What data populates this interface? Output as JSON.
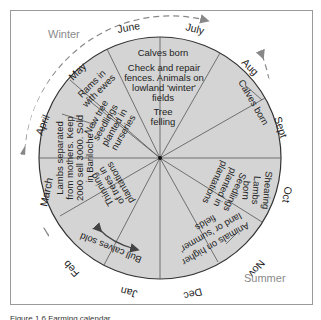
{
  "diagram": {
    "type": "annual-farming-calendar-wheel",
    "colors": {
      "inner_fill": "#d4d4d4",
      "ring_fill": "#ffffff",
      "line": "#555555",
      "dash": "#888888",
      "season_text": "#8a8a8a"
    },
    "seasons": {
      "winter": "Winter",
      "summer": "Summer"
    },
    "months": [
      "June",
      "July",
      "Aug",
      "Sept",
      "Oct",
      "Nov",
      "Dec",
      "Jan",
      "Feb",
      "March",
      "April",
      "May"
    ],
    "activities": {
      "june_july_top": {
        "line1": "Calves born",
        "line2": "Check and repair",
        "line3": "fences. Animals on",
        "line4": "lowland 'winter'",
        "line5": "fields",
        "line6": "Tree",
        "line7": "felling"
      },
      "aug": "Calves born",
      "oct": {
        "line1": "Shearing",
        "line2": "Lambs",
        "line3": "born"
      },
      "oct_inner": {
        "line1": "Seedlings",
        "line2": "planted in",
        "line3": "plantations"
      },
      "nov_dec": {
        "line1": "Animals on higher",
        "line2": "land or 'summer'",
        "line3": "fields"
      },
      "jan_feb": "Bull calves sold",
      "feb_march_inner": {
        "line1": "Thinning",
        "line2": "of trees in",
        "line3": "plantations"
      },
      "march_april": {
        "line1": "Lambs separated",
        "line2": "from mothers. Keep",
        "line3": "2000 sell 3000. Sold",
        "line4": "in Bariloche"
      },
      "may": {
        "line1": "Rams in",
        "line2": "with ewes"
      },
      "may_inner": {
        "line1": "New tree",
        "line2": "seedlings",
        "line3": "planted in",
        "line4": "nurseries"
      }
    },
    "caption": "Figure 1.6  Farming calendar"
  }
}
